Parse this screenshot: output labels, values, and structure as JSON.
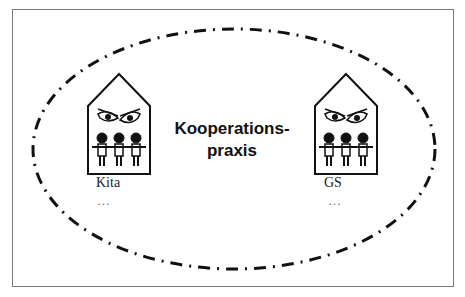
{
  "diagram": {
    "center_label_line1": "Kooperations-",
    "center_label_line2": "praxis",
    "left_institution": {
      "label": "Kita",
      "more": "…"
    },
    "right_institution": {
      "label": "GS",
      "more": "…"
    },
    "ellipse_style": "dash-dot",
    "stroke_color": "#111111"
  }
}
